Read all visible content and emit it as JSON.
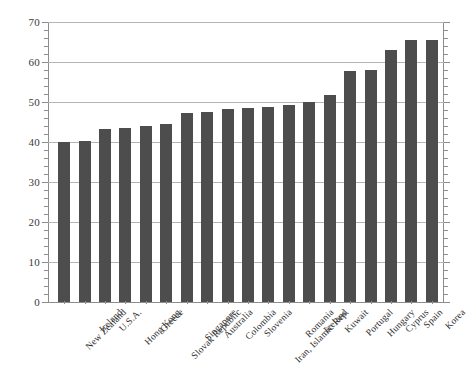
{
  "chart_data": {
    "type": "bar",
    "title": "",
    "subtitle": "",
    "xlabel": "",
    "ylabel": "",
    "ylim": [
      0,
      70
    ],
    "ytick_step": 10,
    "yminor_step": 2,
    "grid": true,
    "legend": "none",
    "bar_color": "#4d4d4d",
    "axis_color": "#8d8d8d",
    "grid_color": "#b5b5b5",
    "categories": [
      "New Zealand",
      "Ireland",
      "U.S.A.",
      "Hong Kong",
      "Greece",
      "Slovak Republic",
      "Singapore",
      "Australia",
      "Colombia",
      "Slovenia",
      "Iran, Islamic Rep.",
      "Romania",
      "Iceland",
      "Kuwait",
      "Portugal",
      "Hungary",
      "Cyprus",
      "Spain",
      "Korea"
    ],
    "values": [
      40.0,
      40.3,
      43.3,
      43.6,
      44.0,
      44.5,
      47.3,
      47.4,
      48.2,
      48.4,
      48.7,
      49.3,
      50.0,
      51.7,
      57.8,
      58.0,
      62.9,
      65.4,
      65.5
    ],
    "ytick_labels": [
      "0",
      "10",
      "20",
      "30",
      "40",
      "50",
      "60",
      "70"
    ],
    "ytick_values": [
      0,
      10,
      20,
      30,
      40,
      50,
      60,
      70
    ]
  }
}
